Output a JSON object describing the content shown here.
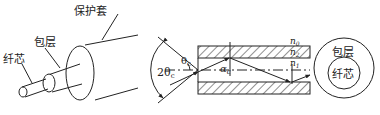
{
  "figure": {
    "left_panel": {
      "labels": {
        "jacket": "保护套",
        "cladding": "包层",
        "core": "纤芯"
      }
    },
    "middle_panel": {
      "labels": {
        "n0": "n",
        "n0_sub": "0",
        "n2": "n",
        "n2_sub": "2",
        "n1": "n",
        "n1_sub": "1",
        "acceptance_angle": "2θ",
        "acceptance_angle_sub": "c",
        "theta": "θ",
        "theta_sub": "c",
        "alpha": "α",
        "alpha_sub": "c"
      }
    },
    "right_panel": {
      "labels": {
        "cladding": "包层",
        "core": "纤芯"
      }
    },
    "colors": {
      "stroke": "#222222",
      "background": "#ffffff"
    }
  }
}
